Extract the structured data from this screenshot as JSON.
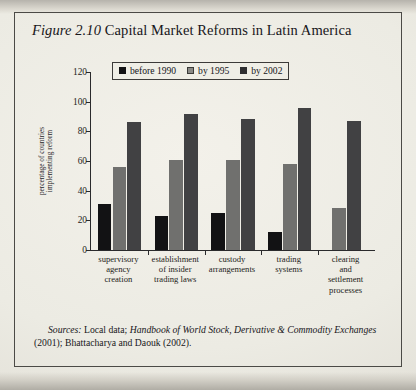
{
  "figure": {
    "label": "Figure 2.10",
    "title": "Capital Market Reforms in Latin America",
    "source_prefix": "Sources:",
    "source_part1": " Local data; ",
    "source_italic": "Handbook of World Stock, Derivative & Commodity Exchanges",
    "source_part2": " (2001); Bhattacharya and Daouk (2002)."
  },
  "colors": {
    "series_before_1990": "#121214",
    "series_by_1995": "#70706e",
    "series_by_2002": "#414143",
    "axis": "#2a2a2c",
    "paper": "#ecebe3",
    "ink": "#17161a"
  },
  "chart_data": {
    "type": "bar",
    "title": "Capital Market Reforms in Latin America",
    "xlabel": "",
    "ylabel": "percentage of countries implementing reform",
    "ylabel_lines": [
      "percentage of countries",
      "implementing reform"
    ],
    "ylim": [
      0,
      120
    ],
    "yticks": [
      0,
      20,
      40,
      60,
      80,
      100,
      120
    ],
    "grid": false,
    "legend_position": "top-center",
    "categories": [
      "supervisory agency creation",
      "establishment of insider trading laws",
      "custody arrangements",
      "trading systems",
      "clearing and settlement processes"
    ],
    "category_lines": [
      [
        "supervisory",
        "agency",
        "creation"
      ],
      [
        "establishment",
        "of insider",
        "trading laws"
      ],
      [
        "custody",
        "arrangements"
      ],
      [
        "trading",
        "systems"
      ],
      [
        "clearing",
        "and",
        "settlement",
        "processes"
      ]
    ],
    "series": [
      {
        "name": "before 1990",
        "color": "#121214",
        "values": [
          31,
          23,
          25,
          12,
          null
        ]
      },
      {
        "name": "by 1995",
        "color": "#70706e",
        "values": [
          56,
          61,
          61,
          58,
          28
        ]
      },
      {
        "name": "by 2002",
        "color": "#414143",
        "values": [
          86,
          92,
          88,
          96,
          87
        ]
      }
    ]
  }
}
